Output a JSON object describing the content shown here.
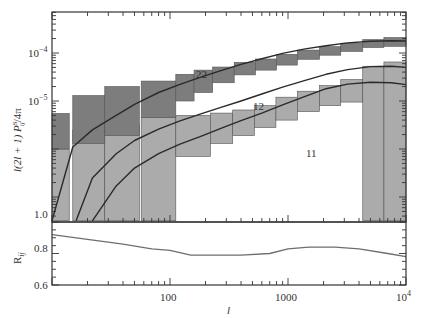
{
  "chart_data": [
    {
      "type": "line",
      "panel": "upper",
      "title": "",
      "xlabel": "l",
      "ylabel": "l(2l + 1) P^S_ij / 4π",
      "xscale": "log",
      "yscale": "log",
      "xlim": [
        10,
        10000
      ],
      "ylim": [
        3e-08,
        0.0007
      ],
      "x_tick_labels": [
        "100",
        "1000",
        "10^4"
      ],
      "y_tick_labels": [
        "10^-4",
        "10^-5",
        "1.0"
      ],
      "grid": false,
      "legend": "none",
      "annotations": [
        {
          "text": "22",
          "near_l": 130
        },
        {
          "text": "12",
          "near_l": 300
        },
        {
          "text": "11",
          "near_l": 600
        }
      ],
      "series": [
        {
          "name": "22",
          "l": [
            10,
            15,
            22,
            35,
            50,
            80,
            120,
            180,
            270,
            400,
            600,
            900,
            1400,
            2100,
            3200,
            5000,
            7500,
            10000
          ],
          "value": [
            3.2e-08,
            1.1e-06,
            2.5e-06,
            5e-06,
            8.5e-06,
            1.5e-05,
            2.2e-05,
            3.1e-05,
            4.3e-05,
            5.8e-05,
            7.6e-05,
            9.8e-05,
            0.000122,
            0.000142,
            0.000162,
            0.000175,
            0.00018,
            0.000178
          ]
        },
        {
          "name": "12",
          "l": [
            16,
            22,
            35,
            50,
            80,
            120,
            180,
            270,
            400,
            600,
            900,
            1400,
            2100,
            3200,
            5000,
            7500,
            10000
          ],
          "value": [
            3.2e-08,
            2.5e-07,
            8e-07,
            1.5e-06,
            2.6e-06,
            3.8e-06,
            5.3e-06,
            7.4e-06,
            1e-05,
            1.4e-05,
            1.95e-05,
            2.7e-05,
            3.6e-05,
            4.5e-05,
            5.2e-05,
            5.3e-05,
            5e-05
          ]
        },
        {
          "name": "11",
          "l": [
            22,
            35,
            50,
            80,
            120,
            180,
            270,
            400,
            600,
            900,
            1400,
            2100,
            3200,
            5000,
            7500,
            10000
          ],
          "value": [
            3.2e-08,
            1.7e-07,
            4e-07,
            8e-07,
            1.25e-06,
            1.8e-06,
            2.7e-06,
            3.9e-06,
            5.6e-06,
            8.3e-06,
            1.25e-05,
            1.8e-05,
            2.25e-05,
            2.45e-05,
            2.4e-05,
            2.2e-05
          ]
        }
      ],
      "error_boxes": [
        {
          "name": "22",
          "color": "#7a7a7a",
          "bins": [
            {
              "l_min": 10,
              "l_max": 14,
              "low": 1e-06,
              "high": 5.5e-06
            },
            {
              "l_min": 15,
              "l_max": 28,
              "low": 1.3e-06,
              "high": 1.3e-05
            },
            {
              "l_min": 28,
              "l_max": 55,
              "low": 1.9e-06,
              "high": 2e-05
            },
            {
              "l_min": 57,
              "l_max": 112,
              "low": 4.5e-06,
              "high": 2.6e-05
            },
            {
              "l_min": 112,
              "l_max": 160,
              "low": 1e-05,
              "high": 3.6e-05
            },
            {
              "l_min": 160,
              "l_max": 230,
              "low": 1.5e-05,
              "high": 4.4e-05
            },
            {
              "l_min": 230,
              "l_max": 350,
              "low": 2.4e-05,
              "high": 5.1e-05
            },
            {
              "l_min": 350,
              "l_max": 530,
              "low": 3.5e-05,
              "high": 6.4e-05
            },
            {
              "l_min": 530,
              "l_max": 800,
              "low": 4.4e-05,
              "high": 7.5e-05
            },
            {
              "l_min": 800,
              "l_max": 1200,
              "low": 5.6e-05,
              "high": 9.4e-05
            },
            {
              "l_min": 1200,
              "l_max": 1850,
              "low": 7.4e-05,
              "high": 0.000115
            },
            {
              "l_min": 1850,
              "l_max": 2800,
              "low": 9e-05,
              "high": 0.000136
            },
            {
              "l_min": 2800,
              "l_max": 4300,
              "low": 0.000108,
              "high": 0.00016
            },
            {
              "l_min": 4300,
              "l_max": 6500,
              "low": 0.00013,
              "high": 0.00019
            },
            {
              "l_min": 6500,
              "l_max": 10000,
              "low": 0.000138,
              "high": 0.00021
            }
          ]
        },
        {
          "name": "11_12",
          "color": "#a8a8a8",
          "bins": [
            {
              "l_min": 10,
              "l_max": 14,
              "low": 3.2e-08,
              "high": 1e-06
            },
            {
              "l_min": 15,
              "l_max": 28,
              "low": 3.2e-08,
              "high": 2.5e-06
            },
            {
              "l_min": 28,
              "l_max": 55,
              "low": 3.2e-08,
              "high": 3.2e-06
            },
            {
              "l_min": 57,
              "l_max": 112,
              "low": 3.2e-08,
              "high": 4.5e-06
            },
            {
              "l_min": 112,
              "l_max": 220,
              "low": 7e-07,
              "high": 5e-06
            },
            {
              "l_min": 220,
              "l_max": 340,
              "low": 1.3e-06,
              "high": 5.6e-06
            },
            {
              "l_min": 340,
              "l_max": 520,
              "low": 1.9e-06,
              "high": 6.5e-06
            },
            {
              "l_min": 520,
              "l_max": 790,
              "low": 2.8e-06,
              "high": 8e-06
            },
            {
              "l_min": 790,
              "l_max": 1200,
              "low": 4e-06,
              "high": 1.2e-05
            },
            {
              "l_min": 1200,
              "l_max": 1850,
              "low": 6e-06,
              "high": 1.6e-05
            },
            {
              "l_min": 1850,
              "l_max": 2800,
              "low": 8e-06,
              "high": 2.1e-05
            },
            {
              "l_min": 2800,
              "l_max": 4300,
              "low": 9.5e-06,
              "high": 2.8e-05
            },
            {
              "l_min": 4300,
              "l_max": 6500,
              "low": 3.2e-08,
              "high": 5.3e-05
            },
            {
              "l_min": 6500,
              "l_max": 10000,
              "low": 3.2e-08,
              "high": 6.5e-05
            }
          ]
        }
      ]
    },
    {
      "type": "line",
      "panel": "lower",
      "xlabel": "l",
      "ylabel": "R_ij",
      "xscale": "log",
      "xlim": [
        10,
        10000
      ],
      "ylim": [
        0.6,
        1.0
      ],
      "y_tick_labels": [
        "0.6",
        "0.8",
        "1.0"
      ],
      "x_tick_labels": [
        "100",
        "1000",
        "10^4"
      ],
      "series": [
        {
          "name": "R_ij",
          "l": [
            10,
            20,
            40,
            70,
            100,
            150,
            250,
            400,
            700,
            1000,
            1500,
            2500,
            4000,
            7000,
            10000
          ],
          "value": [
            0.92,
            0.89,
            0.86,
            0.83,
            0.82,
            0.79,
            0.79,
            0.79,
            0.8,
            0.83,
            0.84,
            0.84,
            0.83,
            0.8,
            0.78
          ]
        }
      ]
    }
  ],
  "labels": {
    "x_axis": "l",
    "y_axis_upper": "l(2l + 1) P",
    "y_axis_upper_sup": "S",
    "y_axis_upper_sub": "ij",
    "y_axis_upper_tail": "/4π",
    "y_axis_lower": "R",
    "y_axis_lower_sub": "ij",
    "tick_100": "100",
    "tick_1000": "1000",
    "tick_1e4_base": "10",
    "tick_1e4_exp": "4",
    "tick_1em4_base": "10",
    "tick_1em4_exp": "−4",
    "tick_1em5_base": "10",
    "tick_1em5_exp": "−5",
    "tick_1_0": "1.0",
    "tick_0_8": "0.8",
    "tick_0_6": "0.6",
    "curve_22": "22",
    "curve_12": "12",
    "curve_11": "11"
  },
  "colors": {
    "dark_box": "#7d7d7d",
    "light_box": "#ababab",
    "box_edge": "#555555",
    "curve": "#2a2a2a",
    "ratio_curve": "#6e6e6e",
    "axis": "#333333"
  }
}
